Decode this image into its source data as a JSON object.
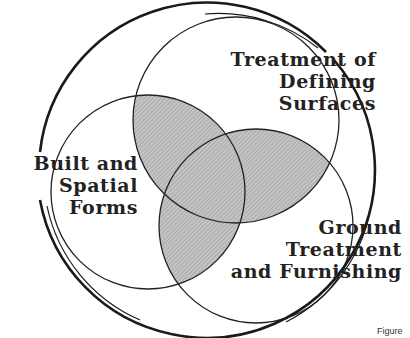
{
  "diagram": {
    "type": "three-set venn diagram enclosed in outer circle",
    "colors": {
      "stroke": "#222222",
      "overlap_fill": "#b9b9b9",
      "background": "#ffffff"
    },
    "sets": [
      {
        "id": "top",
        "label_lines": [
          "Treatment of",
          "Defining",
          "Surfaces"
        ]
      },
      {
        "id": "left",
        "label_lines": [
          "Built and",
          "Spatial",
          "Forms"
        ]
      },
      {
        "id": "bottom-right",
        "label_lines": [
          "Ground",
          "Treatment",
          "and Furnishing"
        ]
      }
    ],
    "caption": "Figure"
  }
}
